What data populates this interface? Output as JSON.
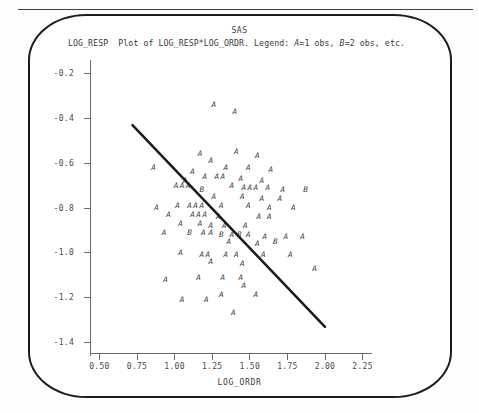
{
  "page": {
    "software_title": "SAS",
    "caption_prefix": "LOG_RESP",
    "caption_body": "Plot of LOG_RESP*LOG_ORDR. Legend: ",
    "legend_a": "A",
    "legend_a_text": "=1 obs, ",
    "legend_b": "B",
    "legend_b_text": "=2 obs, etc."
  },
  "chart_data": {
    "type": "scatter",
    "title": "SAS",
    "subtitle": "Plot of LOG_RESP*LOG_ORDR. Legend: A=1 obs, B=2 obs, etc.",
    "xlabel": "LOG_ORDR",
    "ylabel": "LOG_RESP",
    "xlim": [
      0.4375,
      2.3125
    ],
    "ylim": [
      -1.46,
      -0.14
    ],
    "xticks": [
      0.5,
      0.75,
      1.0,
      1.25,
      1.5,
      1.75,
      2.0,
      2.25
    ],
    "xtick_labels": [
      "0.50",
      "0.75",
      "1.00",
      "1.25",
      "1.50",
      "1.75",
      "2.00",
      "2.25"
    ],
    "yticks": [
      -0.2,
      -0.4,
      -0.6,
      -0.8,
      -1.0,
      -1.2,
      -1.4
    ],
    "ytick_labels": [
      "-0.2",
      "-0.4",
      "-0.6",
      "-0.8",
      "-1.0",
      "-1.2",
      "-1.4"
    ],
    "grid": false,
    "legend_position": "none",
    "marker_glyphs": {
      "A": "1 observation",
      "B": "2 observations"
    },
    "fit_line": {
      "label": "regression line",
      "x": [
        0.72,
        2.0
      ],
      "y": [
        -0.43,
        -1.33
      ]
    },
    "points": [
      {
        "x": 1.26,
        "y": -0.34,
        "m": "A"
      },
      {
        "x": 1.4,
        "y": -0.37,
        "m": "A"
      },
      {
        "x": 1.17,
        "y": -0.56,
        "m": "A"
      },
      {
        "x": 1.41,
        "y": -0.55,
        "m": "A"
      },
      {
        "x": 1.55,
        "y": -0.57,
        "m": "A"
      },
      {
        "x": 0.86,
        "y": -0.62,
        "m": "A"
      },
      {
        "x": 1.24,
        "y": -0.59,
        "m": "A"
      },
      {
        "x": 1.34,
        "y": -0.62,
        "m": "A"
      },
      {
        "x": 1.49,
        "y": -0.62,
        "m": "A"
      },
      {
        "x": 1.64,
        "y": -0.63,
        "m": "A"
      },
      {
        "x": 1.12,
        "y": -0.64,
        "m": "A"
      },
      {
        "x": 1.2,
        "y": -0.66,
        "m": "A"
      },
      {
        "x": 1.28,
        "y": -0.66,
        "m": "A"
      },
      {
        "x": 1.32,
        "y": -0.66,
        "m": "A"
      },
      {
        "x": 1.07,
        "y": -0.68,
        "m": "A"
      },
      {
        "x": 1.44,
        "y": -0.67,
        "m": "A"
      },
      {
        "x": 1.58,
        "y": -0.68,
        "m": "A"
      },
      {
        "x": 1.01,
        "y": -0.7,
        "m": "A"
      },
      {
        "x": 1.05,
        "y": -0.7,
        "m": "A"
      },
      {
        "x": 1.09,
        "y": -0.7,
        "m": "A"
      },
      {
        "x": 1.18,
        "y": -0.72,
        "m": "B"
      },
      {
        "x": 1.38,
        "y": -0.7,
        "m": "A"
      },
      {
        "x": 1.46,
        "y": -0.71,
        "m": "A"
      },
      {
        "x": 1.5,
        "y": -0.71,
        "m": "A"
      },
      {
        "x": 1.54,
        "y": -0.71,
        "m": "A"
      },
      {
        "x": 1.62,
        "y": -0.71,
        "m": "A"
      },
      {
        "x": 1.72,
        "y": -0.72,
        "m": "A"
      },
      {
        "x": 1.87,
        "y": -0.72,
        "m": "B"
      },
      {
        "x": 1.26,
        "y": -0.75,
        "m": "A"
      },
      {
        "x": 1.45,
        "y": -0.75,
        "m": "A"
      },
      {
        "x": 1.58,
        "y": -0.76,
        "m": "A"
      },
      {
        "x": 1.7,
        "y": -0.76,
        "m": "A"
      },
      {
        "x": 0.88,
        "y": -0.8,
        "m": "A"
      },
      {
        "x": 1.02,
        "y": -0.79,
        "m": "A"
      },
      {
        "x": 1.1,
        "y": -0.79,
        "m": "A"
      },
      {
        "x": 1.14,
        "y": -0.79,
        "m": "A"
      },
      {
        "x": 1.18,
        "y": -0.79,
        "m": "A"
      },
      {
        "x": 1.31,
        "y": -0.79,
        "m": "A"
      },
      {
        "x": 1.49,
        "y": -0.79,
        "m": "A"
      },
      {
        "x": 1.63,
        "y": -0.8,
        "m": "A"
      },
      {
        "x": 1.79,
        "y": -0.8,
        "m": "A"
      },
      {
        "x": 0.96,
        "y": -0.83,
        "m": "A"
      },
      {
        "x": 1.12,
        "y": -0.83,
        "m": "A"
      },
      {
        "x": 1.16,
        "y": -0.83,
        "m": "A"
      },
      {
        "x": 1.2,
        "y": -0.83,
        "m": "A"
      },
      {
        "x": 1.29,
        "y": -0.84,
        "m": "A"
      },
      {
        "x": 1.56,
        "y": -0.84,
        "m": "A"
      },
      {
        "x": 1.63,
        "y": -0.84,
        "m": "A"
      },
      {
        "x": 1.04,
        "y": -0.87,
        "m": "A"
      },
      {
        "x": 1.17,
        "y": -0.87,
        "m": "A"
      },
      {
        "x": 1.24,
        "y": -0.88,
        "m": "A"
      },
      {
        "x": 1.33,
        "y": -0.88,
        "m": "A"
      },
      {
        "x": 1.47,
        "y": -0.88,
        "m": "A"
      },
      {
        "x": 0.93,
        "y": -0.91,
        "m": "A"
      },
      {
        "x": 1.1,
        "y": -0.91,
        "m": "B"
      },
      {
        "x": 1.19,
        "y": -0.91,
        "m": "A"
      },
      {
        "x": 1.24,
        "y": -0.91,
        "m": "A"
      },
      {
        "x": 1.31,
        "y": -0.92,
        "m": "B"
      },
      {
        "x": 1.38,
        "y": -0.92,
        "m": "A"
      },
      {
        "x": 1.43,
        "y": -0.92,
        "m": "B"
      },
      {
        "x": 1.49,
        "y": -0.92,
        "m": "A"
      },
      {
        "x": 1.6,
        "y": -0.93,
        "m": "A"
      },
      {
        "x": 1.74,
        "y": -0.93,
        "m": "A"
      },
      {
        "x": 1.85,
        "y": -0.93,
        "m": "A"
      },
      {
        "x": 1.36,
        "y": -0.95,
        "m": "A"
      },
      {
        "x": 1.55,
        "y": -0.96,
        "m": "A"
      },
      {
        "x": 1.67,
        "y": -0.95,
        "m": "B"
      },
      {
        "x": 1.04,
        "y": -1.0,
        "m": "A"
      },
      {
        "x": 1.18,
        "y": -1.01,
        "m": "A"
      },
      {
        "x": 1.22,
        "y": -1.01,
        "m": "A"
      },
      {
        "x": 1.34,
        "y": -1.01,
        "m": "A"
      },
      {
        "x": 1.41,
        "y": -1.01,
        "m": "A"
      },
      {
        "x": 1.59,
        "y": -1.01,
        "m": "A"
      },
      {
        "x": 1.77,
        "y": -1.01,
        "m": "A"
      },
      {
        "x": 1.24,
        "y": -1.04,
        "m": "A"
      },
      {
        "x": 1.45,
        "y": -1.05,
        "m": "A"
      },
      {
        "x": 1.93,
        "y": -1.07,
        "m": "A"
      },
      {
        "x": 0.94,
        "y": -1.12,
        "m": "A"
      },
      {
        "x": 1.16,
        "y": -1.11,
        "m": "A"
      },
      {
        "x": 1.32,
        "y": -1.11,
        "m": "A"
      },
      {
        "x": 1.44,
        "y": -1.11,
        "m": "A"
      },
      {
        "x": 1.46,
        "y": -1.15,
        "m": "A"
      },
      {
        "x": 1.31,
        "y": -1.19,
        "m": "A"
      },
      {
        "x": 1.54,
        "y": -1.19,
        "m": "A"
      },
      {
        "x": 1.05,
        "y": -1.21,
        "m": "A"
      },
      {
        "x": 1.21,
        "y": -1.21,
        "m": "A"
      },
      {
        "x": 1.39,
        "y": -1.27,
        "m": "A"
      }
    ]
  }
}
